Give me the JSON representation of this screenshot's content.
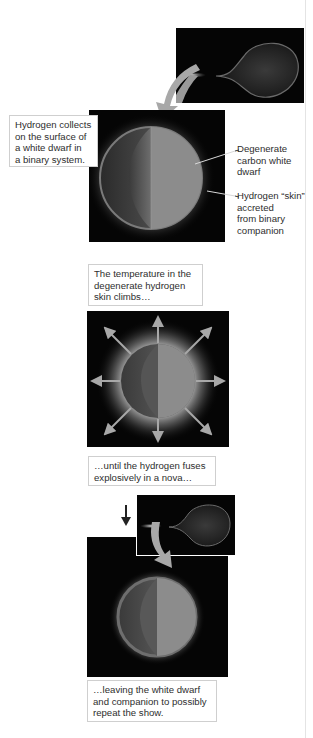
{
  "figure": {
    "type": "nova-sequence-diagram",
    "colors": {
      "background": "#ffffff",
      "panel": "#050505",
      "sphere_surface": "#8c8c8c",
      "sphere_interior": "#555555",
      "skin_ring": "#6e6e6e",
      "arrow": "#a8a8a8",
      "label_border": "#cfcfcf"
    },
    "steps": [
      {
        "id": "accretion",
        "label": "Hydrogen collects on the surface of a white dwarf in a binary system.",
        "label_lines": [
          "Hydrogen collects",
          "on the surface of",
          "a white dwarf in",
          "a binary system."
        ],
        "callouts": [
          {
            "lines": [
              "Degenerate",
              "carbon white",
              "dwarf"
            ]
          },
          {
            "lines": [
              "Hydrogen “skin”",
              "accreted",
              "from binary",
              "companion"
            ]
          }
        ]
      },
      {
        "id": "heating",
        "label_lines": [
          "The temperature in the",
          "degenerate hydrogen",
          "skin climbs…"
        ]
      },
      {
        "id": "nova",
        "label_lines": [
          "…until the hydrogen fuses",
          "explosively in a nova…"
        ]
      },
      {
        "id": "repeat",
        "label_lines": [
          "…leaving the white dwarf",
          "and companion to possibly",
          "repeat the show."
        ]
      }
    ]
  }
}
